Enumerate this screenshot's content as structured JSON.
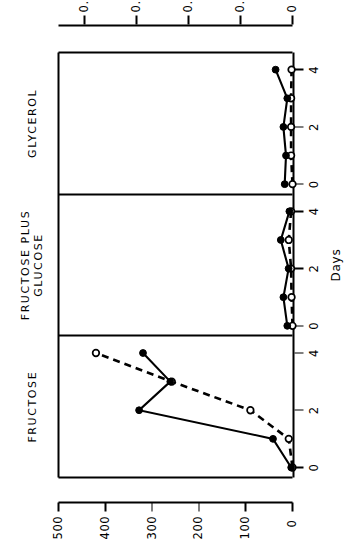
{
  "figure": {
    "xaxis": {
      "label": "Days",
      "ticks": [
        "0",
        "2",
        "4"
      ],
      "min": -0.35,
      "max": 4.6
    },
    "yaxis_left": {
      "label": "Actinomycin (mg / l) o—o",
      "ticks": [
        "0",
        "100",
        "200",
        "300",
        "400",
        "500"
      ],
      "min": 0,
      "max": 500
    },
    "yaxis_right": {
      "label": "",
      "ticks": [
        "0",
        "0.2",
        "0.4",
        "0.6",
        "0.8"
      ],
      "min": 0,
      "max": 0.9
    },
    "panels": [
      {
        "title": "FRUCTOSE",
        "title_lines": [
          "FRUCTOSE"
        ]
      },
      {
        "title": "FRUCTOSE PLUS GLUCOSE",
        "title_lines": [
          "FRUCTOSE PLUS",
          "GLUCOSE"
        ]
      },
      {
        "title": "GLYCEROL",
        "title_lines": [
          "GLYCEROL"
        ]
      }
    ],
    "colors": {
      "ink": "#000000",
      "background": "#ffffff"
    }
  },
  "chart_data": {
    "type": "line",
    "title": "",
    "xlabel": "Days",
    "ylabel": "Actinomycin (mg / l)",
    "ylim": [
      0,
      500
    ],
    "y2lim": [
      0,
      0.9
    ],
    "grid": false,
    "legend": "none",
    "x": [
      0,
      1,
      2,
      3,
      4
    ],
    "panels": [
      {
        "name": "FRUCTOSE",
        "series": [
          {
            "name": "Actinomycin (mg / l)",
            "marker": "open-circle",
            "line": "dashed",
            "axis": "left",
            "x": [
              0,
              1,
              2,
              3,
              4
            ],
            "values": [
              0,
              8,
              90,
              258,
              420
            ]
          },
          {
            "name": "Growth",
            "marker": "filled-circle",
            "line": "solid",
            "axis": "right",
            "x": [
              0,
              1,
              2,
              3,
              4
            ],
            "values": [
              0.005,
              0.075,
              0.59,
              0.47,
              0.575
            ]
          }
        ]
      },
      {
        "name": "FRUCTOSE PLUS GLUCOSE",
        "series": [
          {
            "name": "Actinomycin (mg / l)",
            "marker": "open-circle",
            "line": "dashed",
            "axis": "left",
            "x": [
              0,
              1,
              2,
              3,
              4
            ],
            "values": [
              0,
              2,
              3,
              8,
              3
            ]
          },
          {
            "name": "Growth",
            "marker": "filled-circle",
            "line": "solid",
            "axis": "right",
            "x": [
              0,
              1,
              2,
              3,
              4
            ],
            "values": [
              0.02,
              0.035,
              0.015,
              0.045,
              0.012
            ]
          }
        ]
      },
      {
        "name": "GLYCEROL",
        "series": [
          {
            "name": "Actinomycin (mg / l)",
            "marker": "open-circle",
            "line": "dashed",
            "axis": "left",
            "x": [
              0,
              1,
              2,
              3,
              4
            ],
            "values": [
              0,
              3,
              3,
              3,
              2
            ]
          },
          {
            "name": "Growth",
            "marker": "filled-circle",
            "line": "solid",
            "axis": "right",
            "x": [
              0,
              1,
              2,
              3,
              4
            ],
            "values": [
              0.03,
              0.025,
              0.035,
              0.02,
              0.065
            ]
          }
        ]
      }
    ]
  }
}
